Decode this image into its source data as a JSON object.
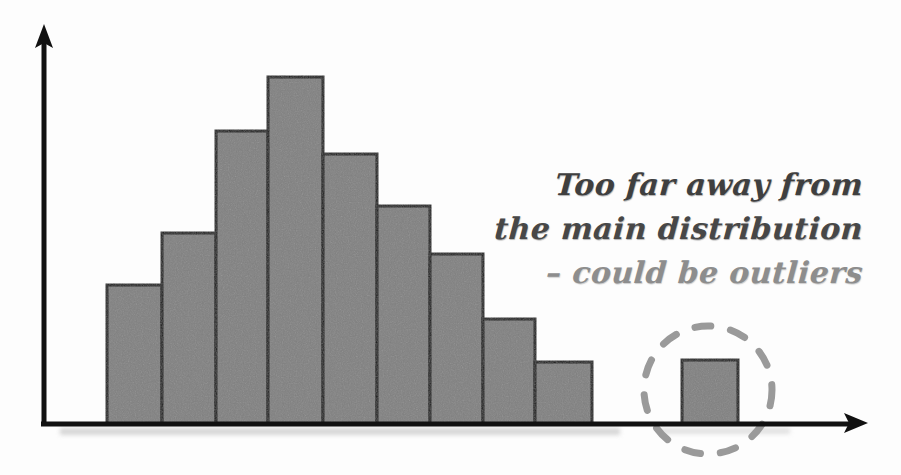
{
  "figure": {
    "name": "histogram-with-outlier",
    "background_color": "#fdfdfd"
  },
  "annotation": {
    "line1": "Too far away from",
    "line2": "the main distribution",
    "line3": "– could be outliers",
    "color": "#4a4a4a"
  },
  "axes": {
    "x_axis_label": "",
    "y_axis_label": "",
    "axis_color": "#111111",
    "x_arrow_icon": "arrow-right-icon",
    "y_arrow_icon": "arrow-up-icon"
  },
  "highlight": {
    "shape": "dashed-circle",
    "color": "#9a9a9a",
    "center_x": 708,
    "center_y": 390,
    "radius": 64
  },
  "chart_data": {
    "type": "bar",
    "title": "",
    "subtitle": "",
    "xlabel": "",
    "ylabel": "",
    "grid": false,
    "legend": null,
    "annotations": [
      "Too far away from",
      "the main distribution",
      "– could be outliers"
    ],
    "bar_fill_color": "#808080",
    "bar_edge_color": "#1a1a1a",
    "xlim": [
      0,
      10.5
    ],
    "ylim": [
      0,
      9
    ],
    "categories": [
      "1",
      "2",
      "3",
      "4",
      "5",
      "6",
      "7",
      "8",
      "9",
      "10",
      "11"
    ],
    "values": [
      2.6,
      3.5,
      5.3,
      6.3,
      4.9,
      4.0,
      3.1,
      2.0,
      1.2,
      0,
      1.2
    ],
    "bars": [
      {
        "index": 1,
        "left": 107,
        "right": 162,
        "top": 285,
        "height_px": 139,
        "value": 2.6,
        "outlier": false
      },
      {
        "index": 2,
        "left": 162,
        "right": 216,
        "top": 233,
        "height_px": 191,
        "value": 3.5,
        "outlier": false
      },
      {
        "index": 3,
        "left": 216,
        "right": 268,
        "top": 131,
        "height_px": 293,
        "value": 5.3,
        "outlier": false
      },
      {
        "index": 4,
        "left": 268,
        "right": 323,
        "top": 77,
        "height_px": 347,
        "value": 6.3,
        "outlier": false
      },
      {
        "index": 5,
        "left": 323,
        "right": 377,
        "top": 154,
        "height_px": 270,
        "value": 4.9,
        "outlier": false
      },
      {
        "index": 6,
        "left": 377,
        "right": 430,
        "top": 206,
        "height_px": 218,
        "value": 4.0,
        "outlier": false
      },
      {
        "index": 7,
        "left": 430,
        "right": 483,
        "top": 254,
        "height_px": 170,
        "value": 3.1,
        "outlier": false
      },
      {
        "index": 8,
        "left": 483,
        "right": 535,
        "top": 319,
        "height_px": 105,
        "value": 2.0,
        "outlier": false
      },
      {
        "index": 9,
        "left": 535,
        "right": 592,
        "top": 362,
        "height_px": 62,
        "value": 1.2,
        "outlier": false
      },
      {
        "index": 11,
        "left": 682,
        "right": 738,
        "top": 360,
        "height_px": 64,
        "value": 1.2,
        "outlier": true
      }
    ],
    "baseline_y": 424,
    "axis_origin": [
      43,
      424
    ],
    "y_axis_top": 28,
    "x_axis_end": 867
  }
}
